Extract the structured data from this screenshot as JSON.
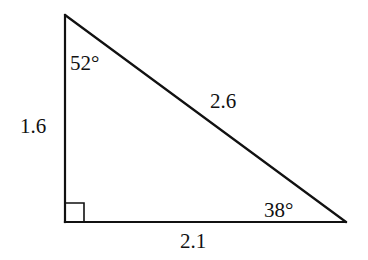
{
  "diagram": {
    "type": "right-triangle",
    "vertices": {
      "top": {
        "x": 65,
        "y": 15
      },
      "right_angle": {
        "x": 65,
        "y": 222
      },
      "right": {
        "x": 346,
        "y": 222
      }
    },
    "right_angle_marker_size": 19,
    "stroke_color": "#111111",
    "background_color": "#ffffff",
    "angles": {
      "top": "52°",
      "right": "38°",
      "bottom_left": "90°"
    },
    "sides": {
      "left_leg": "1.6",
      "hypotenuse": "2.6",
      "bottom_leg": "2.1"
    }
  }
}
